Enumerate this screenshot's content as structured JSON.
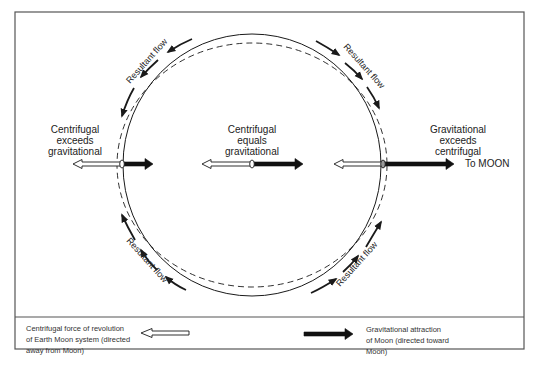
{
  "diagram": {
    "labels": {
      "left": [
        "Centrifugal",
        "exceeds",
        "gravitational"
      ],
      "center": [
        "Centrifugal",
        "equals",
        "gravitational"
      ],
      "right": [
        "Gravitational",
        "exceeds",
        "centrifugal"
      ],
      "to_moon": "To MOON"
    },
    "flow_labels": {
      "top_left": "Resultant flow",
      "top_right": "Resultant flow",
      "bottom_left": "Resultant flow",
      "bottom_right": "Resultant flow"
    },
    "icons": {
      "centrifugal_arrow": "hollow-arrow-left",
      "gravitational_arrow": "solid-arrow-right",
      "flow_arrow": "curved-arrow"
    },
    "colors": {
      "stroke": "#1a1a1a",
      "frame": "#555555",
      "background": "#ffffff"
    }
  },
  "legend": {
    "centrifugal": {
      "line1": "Centrifugal force of revolution",
      "line2": "of Earth Moon system (directed",
      "line3": "away from Moon)"
    },
    "gravitational": {
      "line1": "Gravitational attraction",
      "line2": "of Moon (directed toward",
      "line3": "Moon)"
    }
  }
}
